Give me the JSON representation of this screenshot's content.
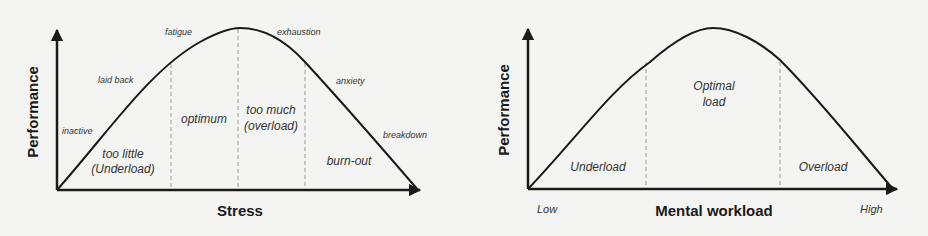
{
  "colors": {
    "line": "#1a1a1a",
    "dashed": "#9a9a9a",
    "label": "#333333",
    "background": "#f4f4f2"
  },
  "left_diagram": {
    "y_axis_title": "Performance",
    "x_axis_title": "Stress",
    "curve_labels": {
      "inactive": "inactive",
      "laid_back": "laid back",
      "fatigue": "fatigue",
      "exhaustion": "exhaustion",
      "anxiety": "anxiety",
      "breakdown": "breakdown"
    },
    "zones": {
      "underload_line1": "too little",
      "underload_line2": "(Underload)",
      "optimum": "optimum",
      "overload_line1": "too much",
      "overload_line2": "(overload)",
      "burnout": "burn-out"
    }
  },
  "right_diagram": {
    "y_axis_title": "Performance",
    "x_axis_title": "Mental workload",
    "x_low": "Low",
    "x_high": "High",
    "zones": {
      "underload": "Underload",
      "optimal_line1": "Optimal",
      "optimal_line2": "load",
      "overload": "Overload"
    }
  }
}
